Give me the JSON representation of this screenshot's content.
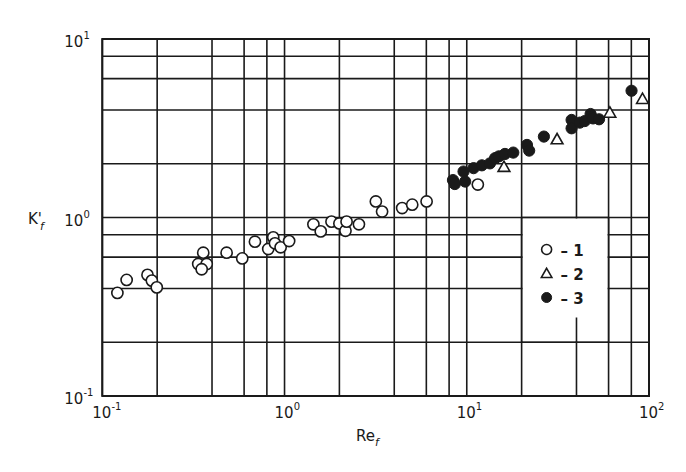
{
  "chart_data": {
    "type": "scatter",
    "title": "",
    "xlabel": "Re",
    "xlabel_sub": "f",
    "ylabel": "K'",
    "ylabel_sub": "f",
    "xscale": "log",
    "yscale": "log",
    "xlim": [
      0.1,
      100
    ],
    "ylim": [
      0.1,
      10
    ],
    "grid": true,
    "x_gridlines": [
      0.1,
      0.2,
      0.4,
      0.6,
      0.8,
      1,
      2,
      4,
      6,
      8,
      10,
      20,
      40,
      60,
      80,
      100
    ],
    "y_gridlines": [
      0.1,
      0.2,
      0.4,
      0.6,
      0.8,
      1,
      2,
      4,
      6,
      8,
      10
    ],
    "x_ticks": [
      {
        "value": 0.1,
        "base": "10",
        "exp": "-1"
      },
      {
        "value": 1,
        "base": "10",
        "exp": "0"
      },
      {
        "value": 10,
        "base": "10",
        "exp": "1"
      },
      {
        "value": 100,
        "base": "10",
        "exp": "2"
      }
    ],
    "y_ticks": [
      {
        "value": 0.1,
        "base": "10",
        "exp": "-1"
      },
      {
        "value": 1,
        "base": "10",
        "exp": "0"
      },
      {
        "value": 10,
        "base": "10",
        "exp": "1"
      }
    ],
    "legend_position": "inside-right",
    "legend": [
      {
        "marker": "open-circle",
        "label": "– 1"
      },
      {
        "marker": "open-triangle",
        "label": "– 2"
      },
      {
        "marker": "filled-circle",
        "label": "– 3"
      }
    ],
    "series": [
      {
        "name": "1",
        "marker": "open-circle",
        "points": [
          [
            0.121,
            0.378
          ],
          [
            0.136,
            0.447
          ],
          [
            0.177,
            0.477
          ],
          [
            0.187,
            0.443
          ],
          [
            0.199,
            0.406
          ],
          [
            0.358,
            0.635
          ],
          [
            0.336,
            0.549
          ],
          [
            0.374,
            0.549
          ],
          [
            0.351,
            0.513
          ],
          [
            0.481,
            0.635
          ],
          [
            0.586,
            0.59
          ],
          [
            0.688,
            0.732
          ],
          [
            0.867,
            0.774
          ],
          [
            0.814,
            0.666
          ],
          [
            0.886,
            0.717
          ],
          [
            0.952,
            0.681
          ],
          [
            1.06,
            0.738
          ],
          [
            1.44,
            0.916
          ],
          [
            1.58,
            0.836
          ],
          [
            1.81,
            0.948
          ],
          [
            2.0,
            0.926
          ],
          [
            2.16,
            0.843
          ],
          [
            2.19,
            0.948
          ],
          [
            2.56,
            0.916
          ],
          [
            3.17,
            1.23
          ],
          [
            3.43,
            1.08
          ],
          [
            4.42,
            1.13
          ],
          [
            5.02,
            1.18
          ],
          [
            6.02,
            1.23
          ],
          [
            11.5,
            1.53
          ]
        ]
      },
      {
        "name": "2",
        "marker": "open-triangle",
        "points": [
          [
            16.0,
            1.92
          ],
          [
            31.3,
            2.74
          ],
          [
            61.0,
            3.86
          ],
          [
            92.1,
            4.61
          ]
        ]
      },
      {
        "name": "3",
        "marker": "filled-circle",
        "points": [
          [
            8.4,
            1.62
          ],
          [
            8.6,
            1.54
          ],
          [
            9.6,
            1.81
          ],
          [
            9.8,
            1.59
          ],
          [
            10.9,
            1.89
          ],
          [
            12.1,
            1.96
          ],
          [
            13.4,
            2.01
          ],
          [
            14.3,
            2.15
          ],
          [
            15.0,
            2.2
          ],
          [
            16.2,
            2.27
          ],
          [
            18.0,
            2.31
          ],
          [
            21.4,
            2.55
          ],
          [
            22.0,
            2.37
          ],
          [
            26.5,
            2.84
          ],
          [
            37.6,
            3.52
          ],
          [
            37.6,
            3.16
          ],
          [
            41.7,
            3.4
          ],
          [
            44.4,
            3.47
          ],
          [
            47.8,
            3.8
          ],
          [
            49.3,
            3.59
          ],
          [
            53.2,
            3.55
          ],
          [
            80.2,
            5.13
          ]
        ]
      }
    ]
  },
  "colors": {
    "ink": "#1a1a1a",
    "background": "#ffffff"
  }
}
